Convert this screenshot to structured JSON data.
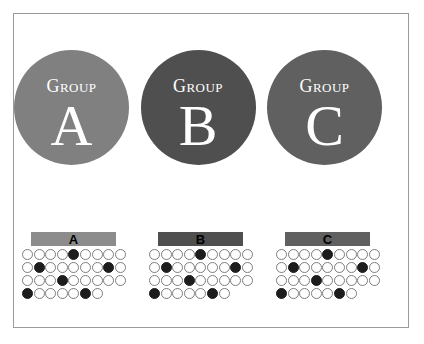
{
  "figure": {
    "background_color": "#ffffff",
    "frame_border_color": "#9a9a9a"
  },
  "circles": [
    {
      "word": "Group",
      "letter": "A",
      "color": "#808080",
      "name": "group-a"
    },
    {
      "word": "Group",
      "letter": "B",
      "color": "#4f4f4f",
      "name": "group-b"
    },
    {
      "word": "Group",
      "letter": "C",
      "color": "#606060",
      "name": "group-c"
    }
  ],
  "panels": [
    {
      "label": "A",
      "bar_color": "#8c8c8c",
      "name": "panel-a"
    },
    {
      "label": "B",
      "bar_color": "#4f4f4f",
      "name": "panel-b"
    },
    {
      "label": "C",
      "bar_color": "#606060",
      "name": "panel-c"
    }
  ],
  "chart_data": {
    "type": "heatmap",
    "title": "",
    "xlabel": "",
    "ylabel": "",
    "open_marker_color": "#ffffff",
    "filled_marker_color": "#1d1d1d",
    "marker_outline_color": "#7d7d7d",
    "rows": 4,
    "columns": 9,
    "legend": [
      {
        "label": "open marker",
        "meaning": "unfilled"
      },
      {
        "label": "filled marker",
        "meaning": "filled"
      }
    ],
    "series": [
      {
        "name": "A",
        "grid": [
          [
            0,
            0,
            0,
            0,
            1,
            0,
            0,
            0,
            0
          ],
          [
            0,
            1,
            0,
            0,
            0,
            0,
            0,
            1,
            0
          ],
          [
            0,
            0,
            0,
            1,
            0,
            0,
            0,
            0,
            0
          ],
          [
            1,
            0,
            0,
            0,
            0,
            1,
            0
          ]
        ],
        "filled_counts": [
          1,
          2,
          1,
          2
        ],
        "total_filled": 6
      },
      {
        "name": "B",
        "grid": [
          [
            0,
            0,
            0,
            0,
            1,
            0,
            0,
            0,
            0
          ],
          [
            0,
            1,
            0,
            0,
            0,
            0,
            0,
            1,
            0
          ],
          [
            0,
            0,
            0,
            1,
            0,
            0,
            0,
            0,
            0
          ],
          [
            1,
            0,
            0,
            0,
            0,
            1,
            0
          ]
        ],
        "filled_counts": [
          1,
          2,
          1,
          2
        ],
        "total_filled": 6
      },
      {
        "name": "C",
        "grid": [
          [
            0,
            0,
            0,
            0,
            1,
            0,
            0,
            0,
            0
          ],
          [
            0,
            1,
            0,
            0,
            0,
            0,
            0,
            1,
            0
          ],
          [
            0,
            0,
            0,
            1,
            0,
            0,
            0,
            0,
            0
          ],
          [
            1,
            0,
            0,
            0,
            0,
            1,
            0
          ]
        ],
        "filled_counts": [
          1,
          2,
          1,
          2
        ],
        "total_filled": 6
      }
    ]
  }
}
